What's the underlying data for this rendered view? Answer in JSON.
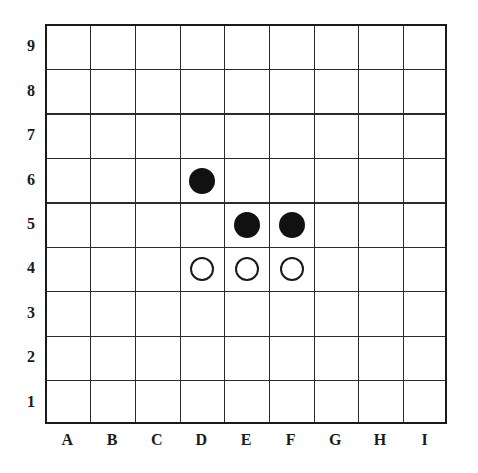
{
  "board": {
    "size": 9,
    "columns": [
      "A",
      "B",
      "C",
      "D",
      "E",
      "F",
      "G",
      "H",
      "I"
    ],
    "rows": [
      "9",
      "8",
      "7",
      "6",
      "5",
      "4",
      "3",
      "2",
      "1"
    ],
    "colors": {
      "line": "#2a2a2a",
      "black_stone": "#111111",
      "white_stone_fill": "#ffffff",
      "white_stone_border": "#1a1a1a",
      "background": "#ffffff"
    }
  },
  "stones": [
    {
      "color": "black",
      "col": "D",
      "row": "6",
      "label": "D6"
    },
    {
      "color": "black",
      "col": "E",
      "row": "5",
      "label": "E5"
    },
    {
      "color": "black",
      "col": "F",
      "row": "5",
      "label": "F5"
    },
    {
      "color": "white",
      "col": "D",
      "row": "4",
      "label": "D4"
    },
    {
      "color": "white",
      "col": "E",
      "row": "4",
      "label": "E4"
    },
    {
      "color": "white",
      "col": "F",
      "row": "4",
      "label": "F4"
    }
  ]
}
